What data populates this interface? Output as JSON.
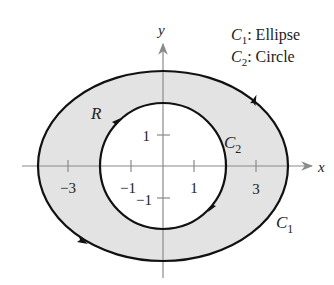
{
  "diagram": {
    "type": "region-between-curves",
    "axes": {
      "x_label": "x",
      "y_label": "y",
      "x_ticks": [
        {
          "value": -3,
          "label": "−3"
        },
        {
          "value": -1,
          "label": "−1"
        },
        {
          "value": 1,
          "label": "1"
        },
        {
          "value": 3,
          "label": "3"
        }
      ],
      "y_ticks": [
        {
          "value": 1,
          "label": "1"
        },
        {
          "value": -1,
          "label": "−1"
        }
      ]
    },
    "legend": [
      {
        "symbol": "C",
        "sub": "1",
        "text": ": Ellipse"
      },
      {
        "symbol": "C",
        "sub": "2",
        "text": ": Circle"
      }
    ],
    "curves": {
      "outer": {
        "name": "C",
        "sub": "1",
        "shape": "ellipse",
        "orientation": "counterclockwise"
      },
      "inner": {
        "name": "C",
        "sub": "2",
        "shape": "circle",
        "orientation": "clockwise"
      }
    },
    "region_label": "R",
    "colors": {
      "region_fill": "#e3e3e3",
      "curve_stroke": "#111111",
      "axis_stroke": "#8a8a8a",
      "text": "#222222"
    }
  }
}
